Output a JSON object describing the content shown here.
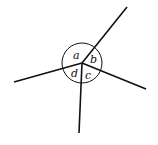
{
  "diagram": {
    "center": {
      "x": 82,
      "y": 63
    },
    "circle_radius": 20,
    "rays": [
      {
        "name": "upper-right",
        "x2": 127,
        "y2": 7
      },
      {
        "name": "right",
        "x2": 146,
        "y2": 89
      },
      {
        "name": "down",
        "x2": 79,
        "y2": 133
      },
      {
        "name": "left",
        "x2": 14,
        "y2": 82
      }
    ],
    "labels": {
      "a": "a",
      "b": "b",
      "c": "c",
      "d": "d"
    },
    "stroke_color": "#111111"
  }
}
